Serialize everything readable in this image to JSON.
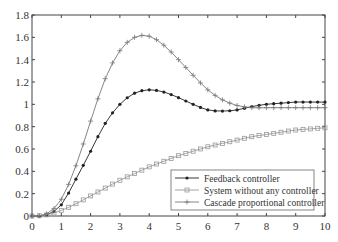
{
  "chart_data": {
    "type": "line",
    "title": "",
    "xlabel": "",
    "ylabel": "",
    "xlim": [
      0,
      10
    ],
    "ylim": [
      0,
      1.8
    ],
    "grid": false,
    "legend_position": "lower right",
    "x_ticks": [
      "0",
      "1",
      "2",
      "3",
      "4",
      "5",
      "6",
      "7",
      "8",
      "9",
      "10"
    ],
    "y_ticks": [
      "0",
      "0.2",
      "0.4",
      "0.6",
      "0.8",
      "1",
      "1.2",
      "1.4",
      "1.6",
      "1.8"
    ],
    "x": [
      0,
      0.5,
      1,
      1.5,
      2,
      2.5,
      3,
      3.5,
      4,
      4.5,
      5,
      5.5,
      6,
      6.5,
      7,
      7.5,
      8,
      8.5,
      9,
      9.5,
      10
    ],
    "series": [
      {
        "name": "Feedback controller",
        "marker": "dot",
        "color": "#222222",
        "values": [
          0,
          0.01,
          0.1,
          0.33,
          0.58,
          0.83,
          1.0,
          1.1,
          1.13,
          1.11,
          1.06,
          1.0,
          0.95,
          0.94,
          0.95,
          0.98,
          1.0,
          1.01,
          1.02,
          1.02,
          1.02
        ]
      },
      {
        "name": "System without any controller",
        "marker": "square",
        "color": "#999999",
        "values": [
          0,
          0.01,
          0.05,
          0.11,
          0.18,
          0.25,
          0.32,
          0.38,
          0.44,
          0.49,
          0.54,
          0.58,
          0.62,
          0.65,
          0.68,
          0.71,
          0.73,
          0.75,
          0.77,
          0.78,
          0.79
        ]
      },
      {
        "name": "Cascade proportional controller",
        "marker": "plus",
        "color": "#777777",
        "values": [
          0,
          0.02,
          0.15,
          0.45,
          0.85,
          1.23,
          1.48,
          1.6,
          1.61,
          1.53,
          1.4,
          1.26,
          1.13,
          1.04,
          0.99,
          0.97,
          0.97,
          0.97,
          0.97,
          0.97,
          0.97
        ]
      }
    ]
  }
}
